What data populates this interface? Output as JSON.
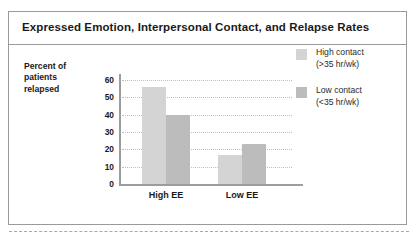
{
  "figure": {
    "title": "Expressed Emotion, Interpersonal Contact, and Relapse Rates",
    "border_color": "#9a9a9a",
    "background": "#ffffff"
  },
  "chart_data": {
    "type": "bar",
    "title": "Expressed Emotion, Interpersonal Contact, and Relapse Rates",
    "xlabel": "",
    "ylabel": "Percent of patients relapsed",
    "ylabel_lines": [
      "Percent of",
      "patients",
      "relapsed"
    ],
    "categories": [
      "High EE",
      "Low EE"
    ],
    "series": [
      {
        "name": "High contact (>35 hr/wk)",
        "name_lines": [
          "High contact",
          "(>35 hr/wk)"
        ],
        "color": "#d4d4d4",
        "values": [
          56,
          17
        ]
      },
      {
        "name": "Low contact (<35 hr/wk)",
        "name_lines": [
          "Low contact",
          "(<35 hr/wk)"
        ],
        "color": "#bcbcbc",
        "values": [
          40,
          23
        ]
      }
    ],
    "ylim": [
      0,
      60
    ],
    "ytick_values": [
      0,
      10,
      20,
      30,
      40,
      50,
      60
    ],
    "ytick_labels": [
      "0",
      "10",
      "20",
      "30",
      "40",
      "50",
      "60"
    ],
    "grid": true,
    "grid_style": "dotted-horizontal",
    "legend_position": "right"
  },
  "legend": {
    "entries": [
      {
        "line1": "High contact",
        "line2": "(>35 hr/wk)",
        "color": "#d4d4d4"
      },
      {
        "line1": "Low contact",
        "line2": "(<35 hr/wk)",
        "color": "#bcbcbc"
      }
    ]
  },
  "axis": {
    "y_caption": {
      "l1": "Percent of",
      "l2": "patients",
      "l3": "relapsed"
    },
    "ticks": [
      "60",
      "50",
      "40",
      "30",
      "20",
      "10",
      "0"
    ],
    "categories": [
      "High EE",
      "Low EE"
    ]
  }
}
